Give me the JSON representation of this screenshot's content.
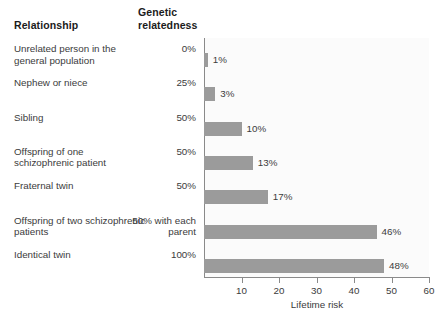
{
  "headers": {
    "relationship": "Relationship",
    "genetic_relatedness": "Genetic\nrelatedness"
  },
  "rows": [
    {
      "label": "Unrelated person in the general population",
      "relatedness": "0%",
      "value_label": "1%",
      "risk": 1
    },
    {
      "label": "Nephew or niece",
      "relatedness": "25%",
      "value_label": "3%",
      "risk": 3
    },
    {
      "label": "Sibling",
      "relatedness": "50%",
      "value_label": "10%",
      "risk": 10
    },
    {
      "label": "Offspring of one schizophrenic patient",
      "relatedness": "50%",
      "value_label": "13%",
      "risk": 13
    },
    {
      "label": "Fraternal twin",
      "relatedness": "50%",
      "value_label": "17%",
      "risk": 17
    },
    {
      "label": "Offspring of two schizophrenic patients",
      "relatedness": "50% with each parent",
      "value_label": "46%",
      "risk": 46
    },
    {
      "label": "Identical twin",
      "relatedness": "100%",
      "value_label": "48%",
      "risk": 48
    }
  ],
  "axis": {
    "xlabel": "Lifetime risk",
    "ticks": [
      10,
      20,
      30,
      40,
      50,
      60
    ],
    "xmin": 0,
    "xmax": 60
  },
  "colors": {
    "bar": "#9b9b9b",
    "axis": "#8a8a8a",
    "text": "#3b3b3b",
    "heading": "#1b1b1b",
    "plot_background": "#fbfbfb"
  },
  "chart_data": {
    "type": "bar",
    "orientation": "horizontal",
    "title": "",
    "xlabel": "Lifetime risk",
    "ylabel": "Relationship",
    "categories": [
      "Unrelated person in the general population",
      "Nephew or niece",
      "Sibling",
      "Offspring of one schizophrenic patient",
      "Fraternal twin",
      "Offspring of two schizophrenic patients",
      "Identical twin"
    ],
    "values": [
      1,
      3,
      10,
      13,
      17,
      46,
      48
    ],
    "data_labels": [
      "1%",
      "3%",
      "10%",
      "13%",
      "17%",
      "46%",
      "48%"
    ],
    "secondary_column": {
      "name": "Genetic relatedness",
      "values": [
        "0%",
        "25%",
        "50%",
        "50%",
        "50%",
        "50% with each parent",
        "100%"
      ]
    },
    "xlim": [
      0,
      60
    ],
    "xticks": [
      10,
      20,
      30,
      40,
      50,
      60
    ],
    "grid": false,
    "legend": false
  }
}
